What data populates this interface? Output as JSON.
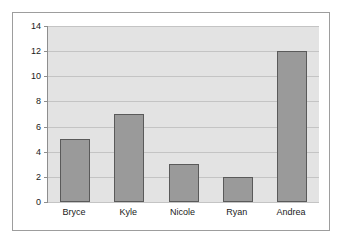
{
  "chart_data": {
    "type": "bar",
    "title": "",
    "subtitle": "",
    "xlabel": "",
    "ylabel": "",
    "categories": [
      "Bryce",
      "Kyle",
      "Nicole",
      "Ryan",
      "Andrea"
    ],
    "values": [
      5,
      7,
      3,
      2,
      12
    ],
    "series": [
      {
        "name": "Series 1",
        "values": [
          5,
          7,
          3,
          2,
          12
        ]
      }
    ],
    "ylim": [
      0,
      14
    ],
    "ytick_labels": [
      "14",
      "12",
      "10",
      "8",
      "6",
      "4",
      "2",
      "0"
    ],
    "ytick_values": [
      14,
      12,
      10,
      8,
      6,
      4,
      2,
      0
    ],
    "ytick_step": 2,
    "grid": true,
    "grid_axis": "y",
    "legend": false,
    "legend_position": "none",
    "annotations": [],
    "colors": {
      "bar_fill": "#9a9a9a",
      "bar_border": "#5a5a5a",
      "plot_background": "#e3e3e3",
      "gridline": "#c4c4c4",
      "axis_line": "#8e8e8e",
      "frame_border": "#9d9d9d",
      "canvas_background": "#ffffff",
      "text": "#1a1a1a"
    }
  }
}
